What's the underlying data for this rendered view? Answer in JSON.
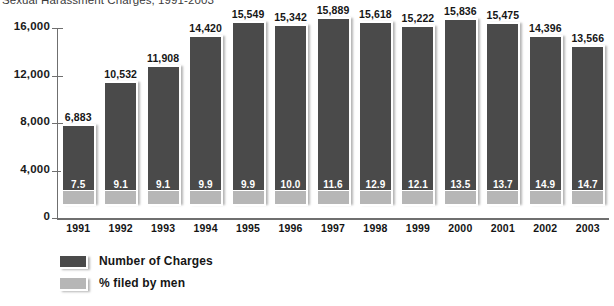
{
  "chart_data": {
    "type": "bar",
    "title": "Sexual Harassment Charges, 1991-2003",
    "xlabel": "",
    "ylabel": "",
    "ylim": [
      0,
      16000
    ],
    "yticks": [
      "0",
      "4,000",
      "8,000",
      "12,000",
      "16,000"
    ],
    "ytick_values": [
      0,
      4000,
      8000,
      12000,
      16000
    ],
    "grid": false,
    "legend_position": "bottom-left",
    "categories": [
      "1991",
      "1992",
      "1993",
      "1994",
      "1995",
      "1996",
      "1997",
      "1998",
      "1999",
      "2000",
      "2001",
      "2002",
      "2003"
    ],
    "series": [
      {
        "name": "Number of Charges",
        "color": "#4a4a4a",
        "values": [
          6883,
          10532,
          11908,
          14420,
          15549,
          15342,
          15889,
          15618,
          15222,
          15836,
          15475,
          14396,
          13566
        ],
        "labels": [
          "6,883",
          "10,532",
          "11,908",
          "14,420",
          "15,549",
          "15,342",
          "15,889",
          "15,618",
          "15,222",
          "15,836",
          "15,475",
          "14,396",
          "13,566"
        ]
      },
      {
        "name": "% filed by men",
        "color": "#b6b6b6",
        "values": [
          7.5,
          9.1,
          9.1,
          9.9,
          9.9,
          10.0,
          11.6,
          12.9,
          12.1,
          13.5,
          13.7,
          14.9,
          14.7
        ],
        "labels": [
          "7.5",
          "9.1",
          "9.1",
          "9.9",
          "9.9",
          "10.0",
          "11.6",
          "12.9",
          "12.1",
          "13.5",
          "13.7",
          "14.9",
          "14.7"
        ]
      }
    ]
  },
  "legend": {
    "items": [
      {
        "label": "Number of Charges",
        "swatch": "dark"
      },
      {
        "label": "% filed by men",
        "swatch": "light"
      }
    ]
  }
}
